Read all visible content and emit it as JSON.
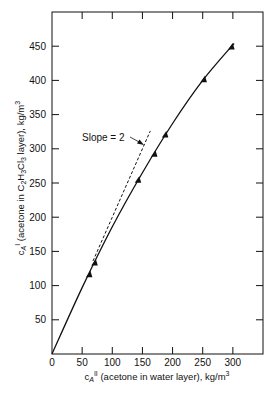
{
  "chart_data": {
    "type": "line",
    "title": "",
    "xlabel": "c_A^II (acetone in water layer), kg/m3",
    "ylabel": "c_A^I (acetone in C2H3Cl3 layer), kg/m3",
    "xlim": [
      0,
      350
    ],
    "ylim": [
      0,
      500
    ],
    "x_ticks": [
      0,
      50,
      100,
      150,
      200,
      250,
      300
    ],
    "y_ticks": [
      50,
      100,
      150,
      200,
      250,
      300,
      350,
      400,
      450
    ],
    "grid": false,
    "legend": null,
    "series": [
      {
        "name": "experimental data",
        "style": "triangle-markers",
        "x": [
          62,
          71,
          143,
          170,
          188,
          252,
          298
        ],
        "y": [
          116,
          133,
          254,
          292,
          320,
          401,
          449
        ]
      },
      {
        "name": "equilibrium curve",
        "style": "solid-line",
        "x": [
          0,
          50,
          100,
          150,
          200,
          250,
          302
        ],
        "y": [
          0,
          97,
          186,
          265,
          337,
          400,
          454
        ]
      },
      {
        "name": "slope 2 tangent",
        "style": "dashed-line",
        "x": [
          68,
          163
        ],
        "y": [
          136,
          326
        ]
      }
    ],
    "annotations": [
      {
        "text": "Slope = 2",
        "points_to": [
          155,
          310
        ]
      }
    ]
  },
  "labels": {
    "x_axis": {
      "main": "c",
      "sub": "A",
      "sup": "II",
      "rest": " (acetone in water layer), kg/m",
      "unit_sup": "3"
    },
    "y_axis": {
      "main": "c",
      "sub": "A",
      "sup": "I",
      "rest1": " (acetone in C",
      "s1": "2",
      "h": "H",
      "s2": "3",
      "cl": "Cl",
      "s3": "3",
      "rest2": " layer), kg/m",
      "unit_sup": "3"
    },
    "slope_annotation": "Slope = 2"
  },
  "colors": {
    "ink": "#111111",
    "background": "#ffffff"
  }
}
